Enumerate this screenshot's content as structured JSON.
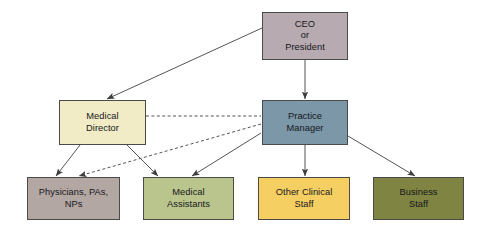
{
  "chart": {
    "type": "organizational-chart",
    "background_color": "#ffffff",
    "line_color": "#555555"
  },
  "nodes": [
    {
      "id": "ceo",
      "label": "CEO\nor\nPresident",
      "level": 1,
      "fill": "#b7aab0",
      "border": "#4a4a4a",
      "x": 262,
      "y": 12,
      "width": 86,
      "height": 48
    },
    {
      "id": "medical-director",
      "label": "Medical\nDirector",
      "level": 2,
      "fill": "#f2ecc6",
      "border": "#4a4a4a",
      "x": 59,
      "y": 100,
      "width": 87,
      "height": 45
    },
    {
      "id": "practice-manager",
      "label": "Practice\nManager",
      "level": 2,
      "fill": "#7b97a8",
      "border": "#4a4a4a",
      "x": 262,
      "y": 100,
      "width": 86,
      "height": 45
    },
    {
      "id": "physicians",
      "label": "Physicians, PAs,\nNPs",
      "level": 3,
      "fill": "#b3a7a4",
      "border": "#4a4a4a",
      "x": 27,
      "y": 177,
      "width": 93,
      "height": 43
    },
    {
      "id": "medical-assistants",
      "label": "Medical\nAssistants",
      "level": 3,
      "fill": "#b9c58d",
      "border": "#4a4a4a",
      "x": 143,
      "y": 177,
      "width": 91,
      "height": 43
    },
    {
      "id": "other-clinical-staff",
      "label": "Other Clinical\nStaff",
      "level": 3,
      "fill": "#f6cf63",
      "border": "#4a4a4a",
      "x": 258,
      "y": 177,
      "width": 92,
      "height": 43
    },
    {
      "id": "business-staff",
      "label": "Business\nStaff",
      "level": 3,
      "fill": "#7f8442",
      "border": "#4a4a4a",
      "x": 373,
      "y": 177,
      "width": 91,
      "height": 43
    }
  ],
  "connectors": [
    {
      "id": "ceo-to-medical-director",
      "from": "ceo",
      "to": "medical-director",
      "style": "solid",
      "arrowhead": true,
      "x1": 262,
      "y1": 28,
      "x2": 107,
      "y2": 99
    },
    {
      "id": "ceo-to-practice-manager",
      "from": "ceo",
      "to": "practice-manager",
      "style": "solid",
      "arrowhead": true,
      "x1": 305,
      "y1": 60,
      "x2": 305,
      "y2": 99
    },
    {
      "id": "medical-director-to-practice-manager",
      "from": "medical-director",
      "to": "practice-manager",
      "style": "dashed",
      "arrowhead": false,
      "x1": 146,
      "y1": 116,
      "x2": 261,
      "y2": 116
    },
    {
      "id": "medical-director-to-physicians",
      "from": "medical-director",
      "to": "physicians",
      "style": "solid",
      "arrowhead": true,
      "x1": 80,
      "y1": 145,
      "x2": 56,
      "y2": 176
    },
    {
      "id": "medical-director-to-medical-assistants",
      "from": "medical-director",
      "to": "medical-assistants",
      "style": "solid",
      "arrowhead": true,
      "x1": 127,
      "y1": 145,
      "x2": 158,
      "y2": 176
    },
    {
      "id": "practice-manager-to-physicians",
      "from": "practice-manager",
      "to": "physicians",
      "style": "dashed",
      "arrowhead": true,
      "x1": 261,
      "y1": 124,
      "x2": 79,
      "y2": 176
    },
    {
      "id": "practice-manager-to-medical-assistants",
      "from": "practice-manager",
      "to": "medical-assistants",
      "style": "solid",
      "arrowhead": true,
      "x1": 261,
      "y1": 133,
      "x2": 192,
      "y2": 176
    },
    {
      "id": "practice-manager-to-other-clinical-staff",
      "from": "practice-manager",
      "to": "other-clinical-staff",
      "style": "solid",
      "arrowhead": true,
      "x1": 305,
      "y1": 145,
      "x2": 305,
      "y2": 176
    },
    {
      "id": "practice-manager-to-business-staff",
      "from": "practice-manager",
      "to": "business-staff",
      "style": "solid",
      "arrowhead": true,
      "x1": 348,
      "y1": 136,
      "x2": 415,
      "y2": 176
    }
  ]
}
